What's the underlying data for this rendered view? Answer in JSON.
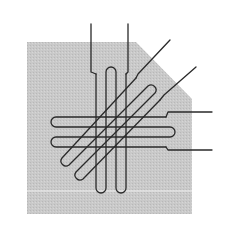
{
  "diagram": {
    "colors": {
      "background": "#ffffff",
      "panel": "#c8c8c8",
      "panel_line": "#eeeeee",
      "wire": "#2a2a2a"
    },
    "panel": {
      "points": "27,42 136,42 192,99 192,214 27,214",
      "highlight_line_y": 191
    },
    "loops": [
      {
        "name": "vertical-loop",
        "orientation": "vertical"
      },
      {
        "name": "horizontal-loop",
        "orientation": "horizontal"
      },
      {
        "name": "diagonal-loop",
        "orientation": "diagonal"
      }
    ],
    "leads": [
      {
        "name": "lead-vertical-left"
      },
      {
        "name": "lead-vertical-right"
      },
      {
        "name": "lead-diagonal-upper"
      },
      {
        "name": "lead-diagonal-lower"
      },
      {
        "name": "lead-horizontal-upper"
      },
      {
        "name": "lead-horizontal-lower"
      }
    ]
  }
}
